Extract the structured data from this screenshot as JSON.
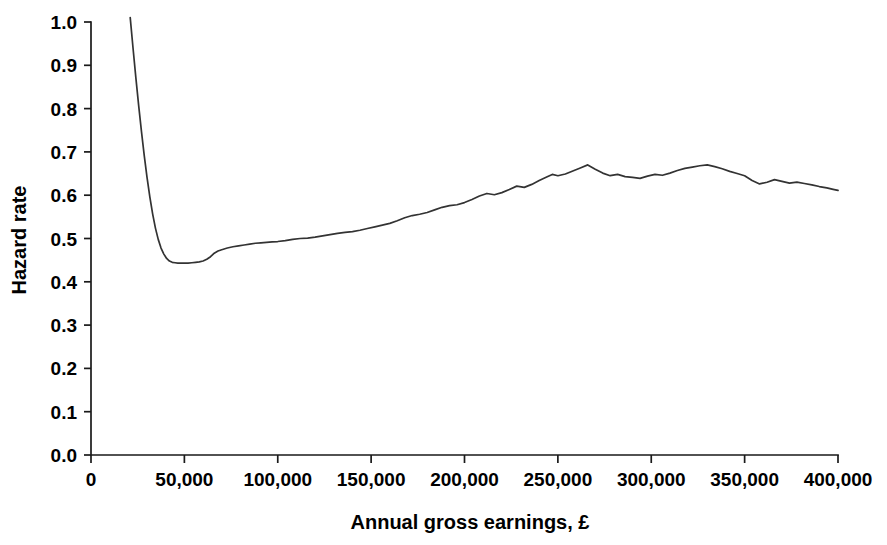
{
  "chart_data": {
    "type": "line",
    "title": "",
    "xlabel": "Annual gross earnings, £",
    "ylabel": "Hazard rate",
    "xlim": [
      0,
      400000
    ],
    "ylim": [
      0.0,
      1.0
    ],
    "grid": false,
    "legend": false,
    "legend_position": "none",
    "line_color": "#333333",
    "xticks": [
      0,
      50000,
      100000,
      150000,
      200000,
      250000,
      300000,
      350000,
      400000
    ],
    "xtick_labels": [
      "0",
      "50,000",
      "100,000",
      "150,000",
      "200,000",
      "250,000",
      "300,000",
      "350,000",
      "400,000"
    ],
    "yticks": [
      0.0,
      0.1,
      0.2,
      0.3,
      0.4,
      0.5,
      0.6,
      0.7,
      0.8,
      0.9,
      1.0
    ],
    "ytick_labels": [
      "0.0",
      "0.1",
      "0.2",
      "0.3",
      "0.4",
      "0.5",
      "0.6",
      "0.7",
      "0.8",
      "0.9",
      "1.0"
    ],
    "series": [
      {
        "name": "Hazard rate",
        "x": [
          21000,
          22500,
          24000,
          25500,
          27000,
          28500,
          30000,
          31500,
          33000,
          34500,
          36000,
          37500,
          39000,
          40500,
          42000,
          43500,
          45000,
          46500,
          48000,
          50000,
          52000,
          54000,
          56000,
          58000,
          60000,
          62000,
          64000,
          66000,
          68000,
          70000,
          73000,
          76000,
          79000,
          82000,
          85000,
          88000,
          91000,
          94000,
          97000,
          100000,
          104000,
          108000,
          112000,
          116000,
          120000,
          124000,
          128000,
          132000,
          136000,
          140000,
          144000,
          148000,
          152000,
          156000,
          160000,
          164000,
          168000,
          172000,
          176000,
          180000,
          184000,
          188000,
          192000,
          196000,
          200000,
          204000,
          208000,
          212000,
          216000,
          220000,
          224000,
          228000,
          232000,
          236000,
          240000,
          244000,
          247000,
          250000,
          254000,
          258000,
          262000,
          266000,
          270000,
          274000,
          278000,
          282000,
          286000,
          290000,
          294000,
          298000,
          302000,
          306000,
          310000,
          314000,
          318000,
          322000,
          326000,
          330000,
          334000,
          338000,
          342000,
          346000,
          350000,
          354000,
          358000,
          362000,
          366000,
          370000,
          374000,
          378000,
          382000,
          386000,
          390000,
          394000,
          398000,
          400000
        ],
        "y": [
          1.01,
          0.94,
          0.872,
          0.808,
          0.748,
          0.692,
          0.641,
          0.596,
          0.557,
          0.524,
          0.498,
          0.478,
          0.464,
          0.454,
          0.448,
          0.445,
          0.444,
          0.443,
          0.443,
          0.443,
          0.443,
          0.444,
          0.445,
          0.446,
          0.448,
          0.452,
          0.458,
          0.466,
          0.471,
          0.474,
          0.478,
          0.481,
          0.483,
          0.485,
          0.487,
          0.489,
          0.49,
          0.491,
          0.492,
          0.493,
          0.495,
          0.498,
          0.5,
          0.501,
          0.503,
          0.506,
          0.509,
          0.512,
          0.514,
          0.516,
          0.519,
          0.523,
          0.527,
          0.531,
          0.535,
          0.541,
          0.548,
          0.553,
          0.556,
          0.56,
          0.566,
          0.572,
          0.576,
          0.578,
          0.583,
          0.59,
          0.598,
          0.604,
          0.601,
          0.606,
          0.613,
          0.621,
          0.618,
          0.625,
          0.634,
          0.642,
          0.648,
          0.645,
          0.649,
          0.656,
          0.663,
          0.67,
          0.66,
          0.651,
          0.645,
          0.648,
          0.643,
          0.641,
          0.639,
          0.644,
          0.648,
          0.646,
          0.651,
          0.657,
          0.662,
          0.665,
          0.668,
          0.67,
          0.666,
          0.661,
          0.655,
          0.65,
          0.645,
          0.634,
          0.626,
          0.63,
          0.636,
          0.632,
          0.628,
          0.63,
          0.627,
          0.624,
          0.62,
          0.617,
          0.613,
          0.611
        ]
      }
    ]
  },
  "axes": {
    "y_title": "Hazard rate",
    "x_title": "Annual gross earnings, £"
  }
}
